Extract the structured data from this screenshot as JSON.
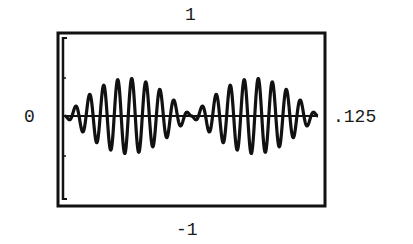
{
  "chart_data": {
    "type": "line",
    "title": "",
    "xlabel": "",
    "ylabel": "",
    "labels": {
      "top": "1",
      "bottom": "-1",
      "left": "0",
      "right": ".125"
    },
    "x_range": [
      0,
      0.125
    ],
    "y_range": [
      -1,
      1
    ],
    "grid": false,
    "legend": null,
    "series": [
      {
        "name": "signal",
        "carrier_cycles": 18,
        "envelope_cycles": 2,
        "peak_amplitude": 0.43,
        "x": [
          0.0,
          0.0625,
          0.125
        ],
        "packet_peak_x": [
          0.031,
          0.094
        ],
        "packet_null_x": [
          0.0,
          0.0625,
          0.125
        ]
      }
    ]
  },
  "frame": {
    "left": 57,
    "top": 32,
    "right": 326,
    "bottom": 207,
    "zero_y": 116,
    "stroke": "#111111"
  }
}
